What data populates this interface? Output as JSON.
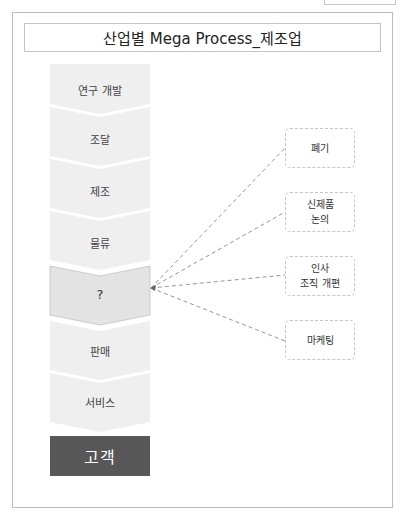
{
  "title": "산업별 Mega Process_제조업",
  "process_steps": [
    {
      "label": "연구 개발",
      "highlight": false
    },
    {
      "label": "조달",
      "highlight": false
    },
    {
      "label": "제조",
      "highlight": false
    },
    {
      "label": "물류",
      "highlight": false
    },
    {
      "label": "?",
      "highlight": true
    },
    {
      "label": "판매",
      "highlight": false
    },
    {
      "label": "서비스",
      "highlight": false
    }
  ],
  "customer": {
    "label": "고객"
  },
  "candidates": [
    {
      "line1": "폐기",
      "line2": ""
    },
    {
      "line1": "신제품",
      "line2": "논의"
    },
    {
      "line1": "인사",
      "line2": "조직 개편"
    },
    {
      "line1": "마케팅",
      "line2": ""
    }
  ],
  "colors": {
    "step_fill": "#eeeeee",
    "highlight_fill": "#e3e3e3",
    "highlight_stroke": "#c2c2c2",
    "customer_fill": "#575757",
    "dash_line": "#8a8a8a"
  }
}
